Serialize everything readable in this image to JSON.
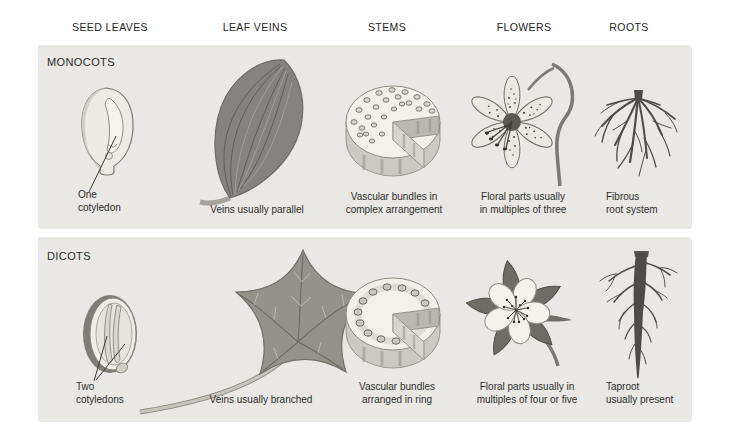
{
  "header": {
    "columns": [
      {
        "label": "SEED LEAVES"
      },
      {
        "label": "LEAF VEINS"
      },
      {
        "label": "STEMS"
      },
      {
        "label": "FLOWERS"
      },
      {
        "label": "ROOTS"
      }
    ]
  },
  "panels": [
    {
      "title": "MONOCOTS",
      "seed_label": "One\ncotyledon",
      "leaf_caption": "Veins usually parallel",
      "stem_caption": "Vascular bundles in\ncomplex arrangement",
      "flower_caption": "Floral parts usually\nin multiples of three",
      "root_caption": "Fibrous\nroot system"
    },
    {
      "title": "DICOTS",
      "seed_label": "Two\ncotyledons",
      "leaf_caption": "Veins usually branched",
      "stem_caption": "Vascular bundles\narranged in ring",
      "flower_caption": "Floral parts usually in\nmultiples of four or five",
      "root_caption": "Taproot\nusually present"
    }
  ],
  "illustrations": {
    "monocot_seed": "corn-kernel-with-single-cotyledon",
    "monocot_leaf": "leaf-with-parallel-veins",
    "monocot_stem": "stem-cross-section-scattered-bundles",
    "monocot_flower": "lily-flower-three-part",
    "monocot_root": "fibrous-root-system",
    "dicot_seed": "bean-seed-with-two-cotyledons",
    "dicot_leaf": "lobed-leaf-with-branched-veins",
    "dicot_stem": "stem-cross-section-ring-bundles",
    "dicot_flower": "columbine-flower-five-part",
    "dicot_root": "taproot-system"
  },
  "colors": {
    "panel_bg": "#e9e8e4",
    "text": "#2e2e2c",
    "ink_dark": "#4e4c46",
    "leaf_gray": "#84837f",
    "face_cream": "#f2f0e8"
  }
}
